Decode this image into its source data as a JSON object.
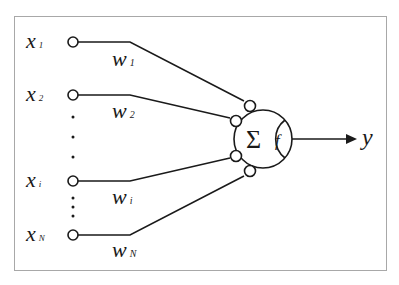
{
  "diagram": {
    "type": "perceptron",
    "inputs": [
      {
        "symbol": "x",
        "index": "1",
        "weight_symbol": "w",
        "weight_index": "1",
        "y": 42
      },
      {
        "symbol": "x",
        "index": "2",
        "weight_symbol": "w",
        "weight_index": "2",
        "y": 95
      },
      {
        "symbol": "x",
        "index": "i",
        "weight_symbol": "w",
        "weight_index": "i",
        "y": 181
      },
      {
        "symbol": "x",
        "index": "N",
        "weight_symbol": "w",
        "weight_index": "N",
        "y": 235
      }
    ],
    "neuron": {
      "sum_symbol": "Σ",
      "activation_symbol": "f"
    },
    "output": {
      "symbol": "y"
    },
    "colors": {
      "stroke": "#1a1a1a",
      "frame": "#a8a8a8",
      "background": "#ffffff"
    }
  }
}
